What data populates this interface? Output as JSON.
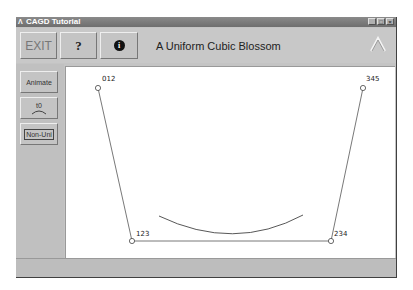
{
  "window": {
    "title": "CAGD Tutorial",
    "controls": [
      "minimize",
      "maximize",
      "close"
    ]
  },
  "toolbar": {
    "exit_label": "EXIT",
    "help_label": "?",
    "info_label": "i",
    "heading": "A Uniform Cubic Blossom",
    "logo_icon": "caret-logo-icon"
  },
  "sidebar": {
    "items": [
      {
        "label": "Animate"
      },
      {
        "label": "t0"
      },
      {
        "label": "Non-Uni"
      }
    ]
  },
  "canvas": {
    "control_points": [
      {
        "label": "012",
        "x": 32,
        "y": 21
      },
      {
        "label": "123",
        "x": 66,
        "y": 174
      },
      {
        "label": "234",
        "x": 265,
        "y": 174
      },
      {
        "label": "345",
        "x": 297,
        "y": 21
      }
    ],
    "curve": {
      "start": [
        93,
        149
      ],
      "control": [
        168,
        185
      ],
      "end": [
        237,
        148
      ]
    },
    "colors": {
      "polygon": "#555555",
      "curve": "#444444",
      "background": "#ffffff"
    }
  },
  "statusbar": {
    "text": ""
  }
}
